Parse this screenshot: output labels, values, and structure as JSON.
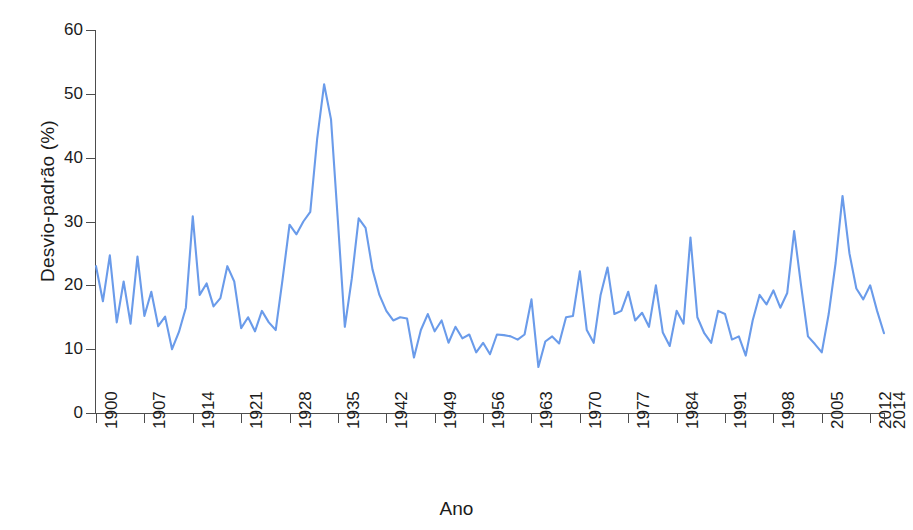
{
  "chart_data": {
    "type": "line",
    "title": "",
    "xlabel": "Ano",
    "ylabel": "Desvio-padrão (%)",
    "xlim": [
      1900,
      2014
    ],
    "ylim": [
      0,
      60
    ],
    "grid": false,
    "legend": null,
    "line_color": "#6a9bea",
    "axis_color": "#4d4d4d",
    "y_ticks": [
      0,
      10,
      20,
      30,
      40,
      50,
      60
    ],
    "y_tick_labels": [
      "0",
      "10",
      "20",
      "30",
      "40",
      "50",
      "60"
    ],
    "x_ticks": [
      1900,
      1907,
      1914,
      1921,
      1928,
      1935,
      1942,
      1949,
      1956,
      1963,
      1970,
      1977,
      1984,
      1991,
      1998,
      2005,
      2012,
      2014
    ],
    "x_tick_labels": [
      "1900",
      "1907",
      "1914",
      "1921",
      "1928",
      "1935",
      "1942",
      "1949",
      "1956",
      "1963",
      "1970",
      "1977",
      "1984",
      "1991",
      "1998",
      "2005",
      "2012",
      "2014"
    ],
    "series": [
      {
        "name": "Desvio-padrão anual",
        "x": [
          1900,
          1901,
          1902,
          1903,
          1904,
          1905,
          1906,
          1907,
          1908,
          1909,
          1910,
          1911,
          1912,
          1913,
          1914,
          1915,
          1916,
          1917,
          1918,
          1919,
          1920,
          1921,
          1922,
          1923,
          1924,
          1925,
          1926,
          1927,
          1928,
          1929,
          1930,
          1931,
          1932,
          1933,
          1934,
          1935,
          1936,
          1937,
          1938,
          1939,
          1940,
          1941,
          1942,
          1943,
          1944,
          1945,
          1946,
          1947,
          1948,
          1949,
          1950,
          1951,
          1952,
          1953,
          1954,
          1955,
          1956,
          1957,
          1958,
          1959,
          1960,
          1961,
          1962,
          1963,
          1964,
          1965,
          1966,
          1967,
          1968,
          1969,
          1970,
          1971,
          1972,
          1973,
          1974,
          1975,
          1976,
          1977,
          1978,
          1979,
          1980,
          1981,
          1982,
          1983,
          1984,
          1985,
          1986,
          1987,
          1988,
          1989,
          1990,
          1991,
          1992,
          1993,
          1994,
          1995,
          1996,
          1997,
          1998,
          1999,
          2000,
          2001,
          2002,
          2003,
          2004,
          2005,
          2006,
          2007,
          2008,
          2009,
          2010,
          2011,
          2012,
          2013,
          2014
        ],
        "values": [
          23.0,
          17.5,
          24.7,
          14.2,
          20.6,
          14.0,
          24.5,
          15.2,
          19.0,
          13.6,
          15.1,
          10.0,
          12.7,
          16.5,
          30.8,
          18.5,
          20.3,
          16.7,
          18.0,
          23.0,
          20.6,
          13.3,
          15.0,
          12.8,
          16.0,
          14.2,
          13.0,
          21.0,
          29.5,
          28.0,
          30.0,
          31.5,
          43.0,
          51.5,
          46.0,
          30.0,
          13.5,
          21.0,
          30.5,
          29.0,
          22.5,
          18.5,
          16.0,
          14.5,
          15.0,
          14.8,
          8.7,
          13.0,
          15.5,
          12.8,
          14.5,
          11.0,
          13.5,
          11.7,
          12.3,
          9.5,
          11.0,
          9.2,
          12.3,
          12.2,
          12.0,
          11.5,
          12.3,
          17.8,
          7.2,
          11.2,
          12.0,
          10.9,
          15.0,
          15.2,
          22.2,
          13.0,
          11.0,
          18.5,
          22.8,
          15.5,
          16.0,
          19.0,
          14.5,
          15.7,
          13.5,
          20.0,
          12.6,
          10.5,
          16.0,
          14.0,
          27.5,
          15.0,
          12.5,
          11.0,
          16.0,
          15.5,
          11.5,
          12.0,
          9.0,
          14.5,
          18.5,
          17.0,
          19.2,
          16.5,
          18.8,
          28.5,
          20.0,
          12.0,
          10.8,
          9.5,
          15.5,
          23.5,
          34.0,
          25.0,
          19.5,
          17.8,
          20.0,
          16.0,
          12.5
        ]
      }
    ]
  },
  "axis": {
    "ylabel": "Desvio-padrão (%)",
    "xlabel": "Ano"
  }
}
